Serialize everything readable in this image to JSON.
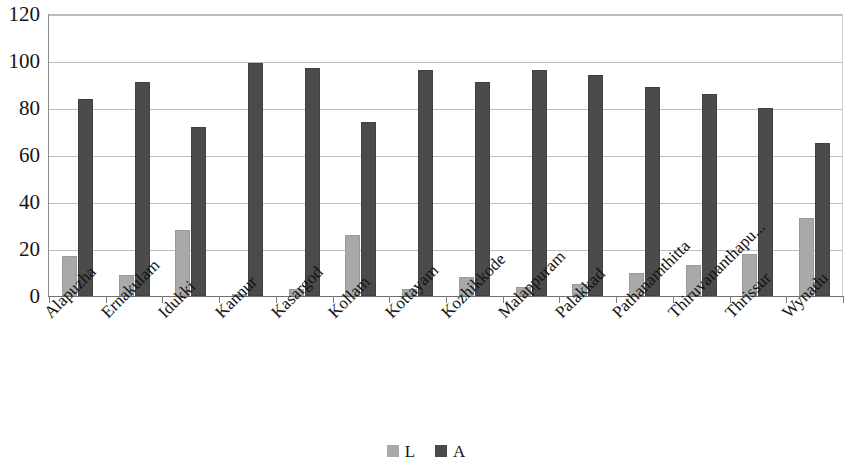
{
  "chart_data": {
    "type": "bar",
    "title": "",
    "subtitle": "",
    "xlabel": "",
    "ylabel": "",
    "ylim": [
      0,
      120
    ],
    "yticks": [
      0,
      20,
      40,
      60,
      80,
      100,
      120
    ],
    "grid": true,
    "legend_position": "bottom",
    "categories": [
      "Alapuzha",
      "Ernakulam",
      "Idukki",
      "Kannur",
      "Kasargod",
      "Kollam",
      "Kottayam",
      "Kozhikkode",
      "Malappuram",
      "Palakkad",
      "Pathanamthitta",
      "Thiruvananthapu...",
      "Thrissur",
      "Wynadu"
    ],
    "series": [
      {
        "name": "L",
        "color": "#a9a9a9",
        "values": [
          17,
          9,
          28,
          1,
          3,
          26,
          3,
          8,
          4,
          5,
          10,
          13,
          18,
          33
        ]
      },
      {
        "name": "A",
        "color": "#4b4b4b",
        "values": [
          84,
          91,
          72,
          99,
          97,
          74,
          96,
          91,
          96,
          94,
          89,
          86,
          80,
          65
        ]
      }
    ]
  },
  "legend": {
    "items": [
      {
        "label": "L",
        "swatch": "legend-swatch-light"
      },
      {
        "label": "A",
        "swatch": "legend-swatch-dark"
      }
    ]
  }
}
